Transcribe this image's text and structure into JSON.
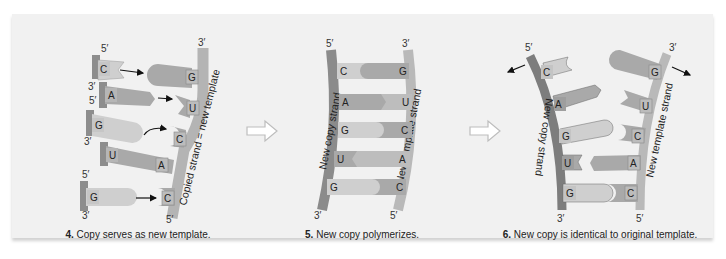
{
  "figure": {
    "colors": {
      "background": "#f1f1f1",
      "dark_strand": "#7d7d7d",
      "light_strand": "#b4b4b4",
      "base_light": "#cfcfcf",
      "base_mid": "#a9a9a9",
      "base_dark": "#999999",
      "nub": "#c2c2c2",
      "arrow_fill": "#ffffff"
    },
    "panels": [
      {
        "step": "4.",
        "caption": "Copy serves as new template.",
        "strand_label": "Copied strand = new template",
        "end_labels": {
          "top_right": "3′",
          "bottom_right": "5′"
        },
        "free_nucleotides": [
          {
            "base": "C",
            "top_label": "5′",
            "bottom_label": "3′"
          },
          {
            "base": "A",
            "top_label": "",
            "bottom_label": ""
          },
          {
            "base": "G",
            "top_label": "5′",
            "bottom_label": "3′"
          },
          {
            "base": "U",
            "top_label": "",
            "bottom_label": ""
          },
          {
            "base": "G",
            "top_label": "5′",
            "bottom_label": "3′"
          }
        ],
        "template_bases": [
          "G",
          "U",
          "C",
          "A",
          "C"
        ]
      },
      {
        "step": "5.",
        "caption": "New copy polymerizes.",
        "left_strand_label": "New copy strand",
        "right_strand_label": "New template strand",
        "end_labels": {
          "top_left": "5′",
          "top_right": "3′",
          "bottom_left": "3′",
          "bottom_right": "5′"
        },
        "pairs": [
          {
            "left": "C",
            "right": "G"
          },
          {
            "left": "A",
            "right": "U"
          },
          {
            "left": "G",
            "right": "C"
          },
          {
            "left": "U",
            "right": "A"
          },
          {
            "left": "G",
            "right": "C"
          }
        ]
      },
      {
        "step": "6.",
        "caption": "New copy is identical to original template.",
        "left_strand_label": "New copy strand",
        "right_strand_label": "New template strand",
        "end_labels": {
          "top_left": "5′",
          "top_right": "3′",
          "bottom_left": "3′",
          "bottom_right": "5′"
        },
        "pairs": [
          {
            "left": "C",
            "right": "G"
          },
          {
            "left": "A",
            "right": "U"
          },
          {
            "left": "G",
            "right": "C"
          },
          {
            "left": "U",
            "right": "A"
          },
          {
            "left": "G",
            "right": "C"
          }
        ]
      }
    ]
  }
}
